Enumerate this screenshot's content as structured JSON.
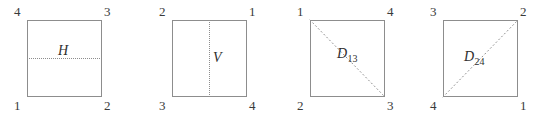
{
  "figure": {
    "width": 545,
    "height": 117,
    "background_color": "#ffffff",
    "line_color": "#8d8d8d",
    "text_color": "#3a3a3a"
  },
  "panels": [
    {
      "id": "panel-h",
      "axis_type": "horizontal",
      "axis_label": "H",
      "axis_subscript": "",
      "corners": {
        "top_left": "4",
        "top_right": "3",
        "bottom_left": "1",
        "bottom_right": "2"
      }
    },
    {
      "id": "panel-v",
      "axis_type": "vertical",
      "axis_label": "V",
      "axis_subscript": "",
      "corners": {
        "top_left": "2",
        "top_right": "1",
        "bottom_left": "3",
        "bottom_right": "4"
      }
    },
    {
      "id": "panel-d13",
      "axis_type": "diagonal-tl-br",
      "axis_label": "D",
      "axis_subscript": "13",
      "corners": {
        "top_left": "1",
        "top_right": "4",
        "bottom_left": "2",
        "bottom_right": "3"
      }
    },
    {
      "id": "panel-d24",
      "axis_type": "diagonal-bl-tr",
      "axis_label": "D",
      "axis_subscript": "24",
      "corners": {
        "top_left": "3",
        "top_right": "2",
        "bottom_left": "4",
        "bottom_right": "1"
      }
    }
  ]
}
